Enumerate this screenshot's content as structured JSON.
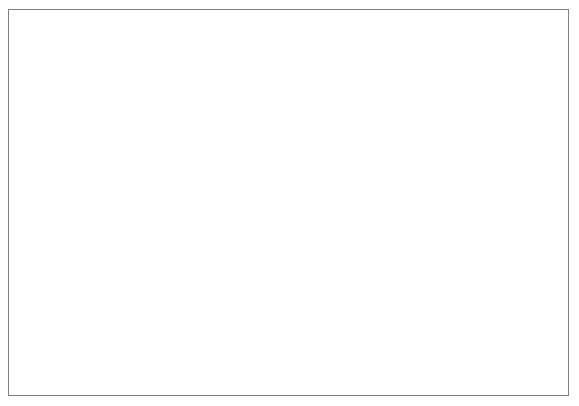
{
  "chart_data": {
    "type": "line",
    "title": "",
    "subtitle": "",
    "xlabel": "",
    "ylabel": "",
    "yscale": "log",
    "ylim": [
      1,
      1000
    ],
    "ytick_labels": [
      "1",
      "10",
      "100",
      "1000"
    ],
    "yticks": [
      1,
      10,
      100,
      1000
    ],
    "grid": true,
    "grid_axis": "y",
    "legend_position": "bottom-right",
    "categories": [
      "1982",
      "1983",
      "1984",
      "1985",
      "1986",
      "1987",
      "1988",
      "1989",
      "1990",
      "1991",
      "1992",
      "1993",
      "1994",
      "1995",
      "1996",
      "1997"
    ],
    "x": [
      1982,
      1983,
      1984,
      1985,
      1986,
      1987,
      1988,
      1989,
      1990,
      1991,
      1992,
      1993,
      1994,
      1995,
      1996,
      1997
    ],
    "series": [
      {
        "name": "No of ships    LPG",
        "marker": "filled-diamond",
        "values": [
          620,
          650,
          665,
          660,
          650,
          645,
          645,
          640,
          660,
          690,
          745,
          790,
          800,
          810,
          855,
          890
        ]
      },
      {
        "name": "LNG",
        "marker": "filled-square",
        "values": [
          70,
          72,
          74,
          80,
          77,
          75,
          74,
          71,
          73,
          76,
          78,
          77,
          81,
          89,
          101,
          105
        ]
      },
      {
        "name": "No of accidents/LPG",
        "marker": "open-triangle",
        "values": [
          2.7,
          6.2,
          4.1,
          4.7,
          3.7,
          3.9,
          7.0,
          4.3,
          6.3,
          4.1,
          3.8,
          4.0,
          4.4,
          2.9,
          3.0,
          2.9
        ]
      },
      {
        "name": "100 Ship  years LPG",
        "marker": "filled-triangle",
        "values": [
          1.35,
          5.6,
          9.5,
          6.4,
          1.0,
          1.0,
          1.0,
          4.3,
          1.25,
          1.25,
          1.25,
          2.45,
          1.15,
          1.0,
          2.9,
          1.8
        ]
      }
    ]
  },
  "legend": {
    "items": [
      {
        "label": "No of ships",
        "suffix": "LPG",
        "marker": "filled-diamond"
      },
      {
        "label": "",
        "suffix": "LNG",
        "marker": "filled-square"
      },
      {
        "label": "No of accidents/LPG",
        "suffix": "",
        "marker": "open-triangle"
      },
      {
        "label": "100 Ship  years LPG",
        "suffix": "",
        "marker": "filled-triangle"
      }
    ]
  },
  "colors": {
    "line": "#000000",
    "grid": "#b0b0b0",
    "axis": "#808080",
    "frame": "#808080",
    "background": "#ffffff",
    "accident_line_halo": "#c8c8c8"
  }
}
